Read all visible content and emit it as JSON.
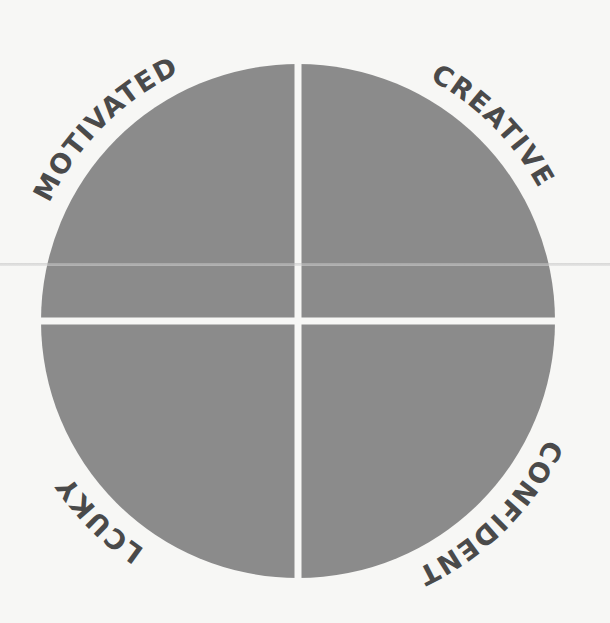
{
  "diagram": {
    "type": "quadrant-circle",
    "center": [
      298,
      321
    ],
    "radius": 257,
    "gap": 7,
    "fill_color": "#8b8b8b",
    "text_color": "#4a4a4a",
    "background_color": "#f7f7f5",
    "quadrants": [
      {
        "position": "top-left",
        "label": "MOTIVATED"
      },
      {
        "position": "top-right",
        "label": "CREATIVE"
      },
      {
        "position": "bottom-right",
        "label": "CONFIDENT"
      },
      {
        "position": "bottom-left",
        "label": "LCUKY"
      }
    ]
  }
}
